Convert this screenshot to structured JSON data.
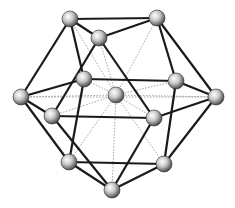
{
  "diagram": {
    "colors": {
      "edge": "#1a1a1a",
      "dashed": "#9a9a9a",
      "ball_light": "#ffffff",
      "ball_mid": "#b4b4b4",
      "ball_dark": "#3c3c3c"
    },
    "ball_radius": 8,
    "nodes": [
      {
        "id": "TL",
        "x": 70,
        "y": 19
      },
      {
        "id": "TR",
        "x": 157,
        "y": 18
      },
      {
        "id": "UM",
        "x": 99,
        "y": 38
      },
      {
        "id": "L",
        "x": 21,
        "y": 97
      },
      {
        "id": "MLB",
        "x": 84,
        "y": 79
      },
      {
        "id": "C",
        "x": 116,
        "y": 95
      },
      {
        "id": "MRB",
        "x": 176,
        "y": 81
      },
      {
        "id": "R",
        "x": 216,
        "y": 97
      },
      {
        "id": "MLF",
        "x": 52,
        "y": 116
      },
      {
        "id": "MRF",
        "x": 154,
        "y": 118
      },
      {
        "id": "BL",
        "x": 69,
        "y": 162
      },
      {
        "id": "BR",
        "x": 164,
        "y": 164
      },
      {
        "id": "B",
        "x": 112,
        "y": 190
      }
    ],
    "solid_edges": [
      [
        "TL",
        "TR"
      ],
      [
        "TL",
        "UM"
      ],
      [
        "UM",
        "TR"
      ],
      [
        "TL",
        "L"
      ],
      [
        "TL",
        "MLB"
      ],
      [
        "TR",
        "MRB"
      ],
      [
        "TR",
        "R"
      ],
      [
        "MRB",
        "R"
      ],
      [
        "L",
        "MLB"
      ],
      [
        "L",
        "MLF"
      ],
      [
        "MLB",
        "MRB"
      ],
      [
        "UM",
        "MLF"
      ],
      [
        "UM",
        "MRF"
      ],
      [
        "MLF",
        "MRF"
      ],
      [
        "MRF",
        "R"
      ],
      [
        "L",
        "BL"
      ],
      [
        "MLB",
        "BL"
      ],
      [
        "MLF",
        "B"
      ],
      [
        "BL",
        "B"
      ],
      [
        "BL",
        "BR"
      ],
      [
        "MRF",
        "B"
      ],
      [
        "MRB",
        "BR"
      ],
      [
        "R",
        "BR"
      ],
      [
        "BR",
        "B"
      ]
    ],
    "dashed_edges": [
      [
        "C",
        "TL"
      ],
      [
        "C",
        "TR"
      ],
      [
        "C",
        "UM"
      ],
      [
        "C",
        "L"
      ],
      [
        "C",
        "MLB"
      ],
      [
        "C",
        "MRB"
      ],
      [
        "C",
        "R"
      ],
      [
        "C",
        "MLF"
      ],
      [
        "C",
        "MRF"
      ],
      [
        "C",
        "BL"
      ],
      [
        "C",
        "BR"
      ],
      [
        "C",
        "B"
      ],
      [
        "L",
        "R"
      ]
    ]
  }
}
